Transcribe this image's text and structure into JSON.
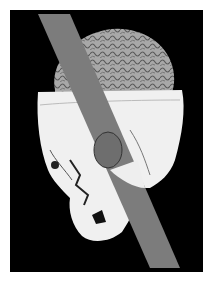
{
  "image": {
    "subject": "3D reconstruction of skull with exposed brain pierced by a tamping iron rod",
    "elements": [
      "black background",
      "brain",
      "skull",
      "rod"
    ],
    "colors": {
      "background": "#000000",
      "skull": "#f2f2f2",
      "brain": "#9a9a9a",
      "rod": "#7a7a7a",
      "page": "#ffffff"
    }
  }
}
